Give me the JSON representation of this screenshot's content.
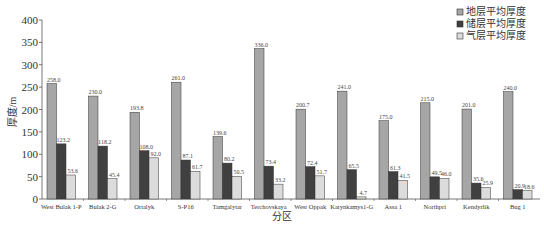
{
  "chart_data": {
    "type": "bar",
    "title": "",
    "xlabel": "分区",
    "ylabel": "厚度/m",
    "ylim": [
      0,
      400
    ],
    "yticks": [
      0,
      50,
      100,
      150,
      200,
      250,
      300,
      350,
      400
    ],
    "grid": false,
    "legend_position": "top-right",
    "categories": [
      "West Bulak 1-P",
      "Bulak 2-G",
      "Ortalyk",
      "S-P16",
      "Tamgalytar",
      "Terchovskaya",
      "West Oppak",
      "Katynkamys1-G",
      "Assa 1",
      "Northpri",
      "Kendyrlik",
      "Bug 1"
    ],
    "series": [
      {
        "name": "地层平均厚度",
        "color": "#a6a6a6",
        "values": [
          258.0,
          230.0,
          193.8,
          261.0,
          139.6,
          336.0,
          200.7,
          241.0,
          175.0,
          215.0,
          201.0,
          240.0
        ]
      },
      {
        "name": "储层平均厚度",
        "color": "#404040",
        "values": [
          123.2,
          118.2,
          108.0,
          87.1,
          80.2,
          73.4,
          72.4,
          65.5,
          61.3,
          49.5,
          35.6,
          20.9
        ]
      },
      {
        "name": "气层平均厚度",
        "color": "#dcdcdc",
        "values": [
          53.6,
          45.4,
          92.0,
          61.7,
          50.5,
          33.2,
          51.7,
          4.7,
          41.5,
          46.0,
          25.9,
          18.6
        ]
      }
    ],
    "value_labels": [
      [
        "258.0",
        "230.0",
        "193.8",
        "261.0",
        "139.6",
        "336.0",
        "200.7",
        "241.0",
        "175.0",
        "215.0",
        "201.0",
        "240.0"
      ],
      [
        "123.2",
        "118.2",
        "108.0",
        "87.1",
        "80.2",
        "73.4",
        "72.4",
        "65.5",
        "61.3",
        "49.5",
        "35.6",
        "20.9"
      ],
      [
        "53.6",
        "45.4",
        "92.0",
        "61.7",
        "50.5",
        "33.2",
        "51.7",
        "4.7",
        "41.5",
        "46.0",
        "25.9",
        "18.6"
      ]
    ]
  }
}
